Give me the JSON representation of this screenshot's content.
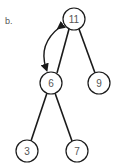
{
  "figure_label": "b.",
  "colors": {
    "stroke": "#1a1a1a",
    "text": "#555555",
    "background": "#ffffff"
  },
  "tree": {
    "nodes": [
      {
        "id": "n11",
        "value": "11",
        "cx": 74,
        "cy": 19
      },
      {
        "id": "n6",
        "value": "6",
        "cx": 51,
        "cy": 83
      },
      {
        "id": "n9",
        "value": "9",
        "cx": 99,
        "cy": 83
      },
      {
        "id": "n3",
        "value": "3",
        "cx": 27,
        "cy": 151
      },
      {
        "id": "n7",
        "value": "7",
        "cx": 77,
        "cy": 151
      }
    ],
    "edges": [
      {
        "from": "n11",
        "to": "n6"
      },
      {
        "from": "n11",
        "to": "n9"
      },
      {
        "from": "n6",
        "to": "n3"
      },
      {
        "from": "n6",
        "to": "n7"
      }
    ],
    "swap_arrow": {
      "between": [
        "n11",
        "n6"
      ],
      "type": "double-headed-curve"
    }
  }
}
